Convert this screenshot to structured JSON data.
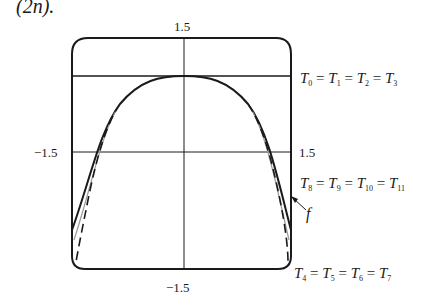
{
  "caption_fragment": "(2n).",
  "axes": {
    "top_tick": "1.5",
    "bottom_tick": "−1.5",
    "left_tick": "−1.5",
    "right_tick": "1.5"
  },
  "annotations": {
    "t_top": [
      "T",
      "0",
      "T",
      "1",
      "T",
      "2",
      "T",
      "3"
    ],
    "t_mid": [
      "T",
      "8",
      "T",
      "9",
      "T",
      "10",
      "T",
      "11"
    ],
    "t_bottom": [
      "T",
      "4",
      "T",
      "5",
      "T",
      "6",
      "T",
      "7"
    ],
    "f_label": "f"
  },
  "colors": {
    "ink": "#1a1a1a",
    "light_ink": "#9a9a9a"
  }
}
